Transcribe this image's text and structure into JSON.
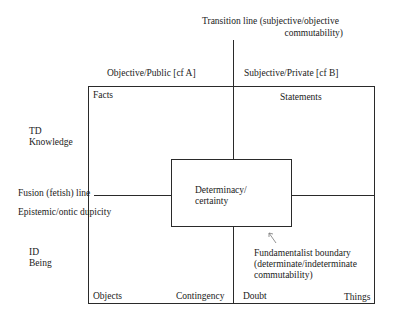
{
  "diagram": {
    "transition_line": {
      "line1": "Transition line (subjective/objective",
      "line2": "commutability)"
    },
    "column_headers": {
      "left": "Objective/Public [cf A]",
      "right": "Subjective/Private [cf B]"
    },
    "row_labels": {
      "top": {
        "line1": "TD",
        "line2": "Knowledge"
      },
      "bottom": {
        "line1": "ID",
        "line2": "Being"
      }
    },
    "fusion_line": "Fusion (fetish) line",
    "epistemic": "Epistemic/ontic dupicity",
    "center": {
      "line1": "Determinacy/",
      "line2": "certainty"
    },
    "fundamentalist": {
      "line1": "Fundamentalist boundary",
      "line2": "(determinate/indeterminate",
      "line3": "commutability)"
    },
    "corners": {
      "top_left": "Facts",
      "top_right": "Statements",
      "bottom_left": "Objects",
      "bottom_mid_left": "Contingency",
      "bottom_mid_right": "Doubt",
      "bottom_right": "Things"
    }
  }
}
